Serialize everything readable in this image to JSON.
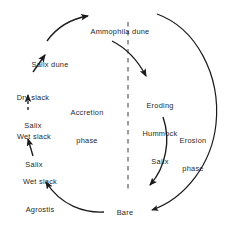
{
  "diagram": {
    "type": "cycle-diagram",
    "colors": {
      "background": "#ffffff",
      "stroke": "#1a1a1a",
      "text": "#262626",
      "divider": "#3a3a3a"
    },
    "nodes": [
      {
        "id": "ammophila-dune",
        "lines": [
          "Ammophila dune"
        ],
        "line1": "Ammophila dune"
      },
      {
        "id": "salix-dune",
        "lines": [
          "Salix dune"
        ],
        "line1": "Salix dune"
      },
      {
        "id": "dry-slack-salix",
        "lines": [
          "Dry slack",
          "Salix"
        ],
        "line1": "Dry slack",
        "line2": "Salix"
      },
      {
        "id": "wet-slack-salix",
        "lines": [
          "Wet slack",
          "Salix"
        ],
        "line1": "Wet slack",
        "line2": "Salix"
      },
      {
        "id": "wet-slack-agrostis",
        "lines": [
          "Wet slack",
          "Agrostis"
        ],
        "line1": "Wet slack",
        "line2": "Agrostis"
      },
      {
        "id": "bare-damp-sand",
        "lines": [
          "Bare",
          "damp",
          "sand"
        ],
        "line1": "Bare",
        "line2": "damp",
        "line3": "sand"
      },
      {
        "id": "eroding-hummock-salix",
        "lines": [
          "Eroding",
          "Hummock",
          "Salix"
        ],
        "line1": "Eroding",
        "line2": "Hummock",
        "line3": "Salix"
      }
    ],
    "phases": [
      {
        "id": "accretion-phase",
        "line1": "Accretion",
        "line2": "phase"
      },
      {
        "id": "erosion-phase",
        "line1": "Erosion",
        "line2": "phase"
      }
    ],
    "divider": {
      "id": "phase-divider",
      "style": "dashed-vertical"
    },
    "edges": [
      {
        "from": "bare-damp-sand",
        "to": "wet-slack-agrostis",
        "style": "curved-arrow"
      },
      {
        "from": "wet-slack-agrostis",
        "to": "wet-slack-salix",
        "style": "straight-arrow"
      },
      {
        "from": "wet-slack-salix",
        "to": "dry-slack-salix",
        "style": "dashed-arrow"
      },
      {
        "from": "dry-slack-salix",
        "to": "salix-dune",
        "style": "straight-arrow"
      },
      {
        "from": "salix-dune",
        "to": "ammophila-dune",
        "style": "curved-arrow"
      },
      {
        "from": "ammophila-dune",
        "to": "eroding-hummock-salix",
        "style": "curved-arrow"
      },
      {
        "from": "eroding-hummock-salix",
        "to": "bare-damp-sand",
        "style": "curved-arrow"
      },
      {
        "from": "ammophila-dune",
        "to": "bare-damp-sand",
        "style": "outer-curved-arrow"
      }
    ]
  }
}
